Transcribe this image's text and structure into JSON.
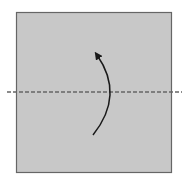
{
  "diagram": {
    "type": "origami-fold-step",
    "paper": {
      "x": 16,
      "y": 12,
      "width": 155,
      "height": 160,
      "fill": "#c8c8c8",
      "stroke": "#666666"
    },
    "fold_line": {
      "kind": "valley-fold",
      "y": 92,
      "x1": 7,
      "x2": 182,
      "color": "#666666",
      "dash": "4,2"
    },
    "arrow": {
      "direction": "fold-bottom-up",
      "color": "#1a1a1a",
      "path": "M 93 135 Q 125 95 96 52"
    }
  }
}
